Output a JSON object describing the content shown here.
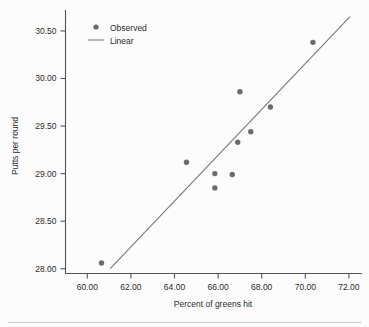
{
  "chart_data": {
    "type": "scatter",
    "title": "",
    "xlabel": "Percent of greens hit",
    "ylabel": "Putts per round",
    "xlim": [
      59.0,
      72.6
    ],
    "ylim": [
      27.95,
      30.72
    ],
    "grid": false,
    "legend_position": "top-left",
    "xticks": [
      60.0,
      62.0,
      64.0,
      66.0,
      68.0,
      70.0,
      72.0
    ],
    "xtick_labels": [
      "60.00",
      "62.00",
      "64.00",
      "66.00",
      "68.00",
      "70.00",
      "72.00"
    ],
    "yticks": [
      28.0,
      28.5,
      29.0,
      29.5,
      30.0,
      30.5
    ],
    "ytick_labels": [
      "28.00",
      "28.50",
      "29.00",
      "29.50",
      "30.00",
      "30.50"
    ],
    "series": [
      {
        "name": "Observed",
        "type": "scatter",
        "marker": "circle",
        "color": "#6b6b6b",
        "points": [
          {
            "x": 60.65,
            "y": 28.06
          },
          {
            "x": 64.55,
            "y": 29.12
          },
          {
            "x": 65.85,
            "y": 29.0
          },
          {
            "x": 65.85,
            "y": 28.85
          },
          {
            "x": 66.65,
            "y": 28.99
          },
          {
            "x": 66.9,
            "y": 29.33
          },
          {
            "x": 67.0,
            "y": 29.86
          },
          {
            "x": 67.5,
            "y": 29.44
          },
          {
            "x": 68.4,
            "y": 29.7
          },
          {
            "x": 70.35,
            "y": 30.38
          }
        ]
      },
      {
        "name": "Linear",
        "type": "line",
        "color": "#777777",
        "endpoints": [
          {
            "x": 61.05,
            "y": 28.0
          },
          {
            "x": 72.05,
            "y": 30.65
          }
        ]
      }
    ]
  },
  "legend": {
    "entries": [
      {
        "label": "Observed",
        "marker": "circle",
        "color": "#6b6b6b"
      },
      {
        "label": "Linear",
        "marker": "line",
        "color": "#888888"
      }
    ]
  },
  "axes": {
    "x_title": "Percent of greens hit",
    "y_title": "Putts per round"
  },
  "colors": {
    "marker": "#6b6b6b",
    "fit_line": "#777777",
    "spine": "#555555",
    "text": "#2b2b2b",
    "background": "#fcfcfc"
  }
}
